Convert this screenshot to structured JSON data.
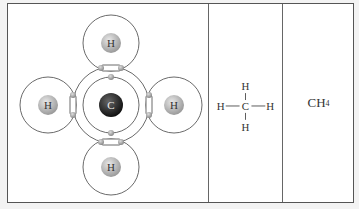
{
  "figure": {
    "panels": [
      {
        "name": "electron-shell-model",
        "central_atom": "C",
        "outer_atoms": [
          "H",
          "H",
          "H",
          "H"
        ]
      },
      {
        "name": "structural-formula",
        "center": "C",
        "top": "H",
        "bottom": "H",
        "left": "H",
        "right": "H"
      },
      {
        "name": "molecular-formula",
        "element1": "CH",
        "subscript": "4"
      }
    ]
  }
}
